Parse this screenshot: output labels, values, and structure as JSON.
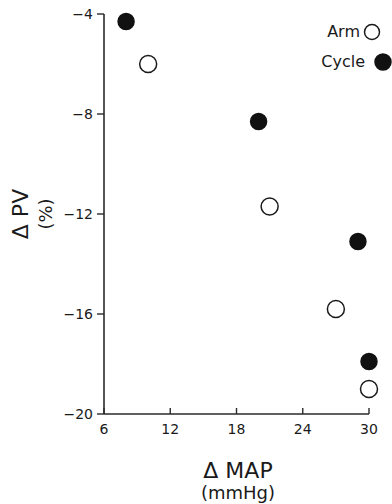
{
  "chart_data": {
    "type": "scatter",
    "title": "",
    "xlabel": "Δ MAP",
    "xlabel_units": "(mmHg)",
    "ylabel": "Δ PV",
    "ylabel_units": "(%)",
    "xlim": [
      6,
      30
    ],
    "ylim": [
      -20,
      -4
    ],
    "x_ticks": [
      6,
      12,
      18,
      24,
      30
    ],
    "y_ticks": [
      -4,
      -8,
      -12,
      -16,
      -20
    ],
    "x_tick_labels": [
      "6",
      "12",
      "18",
      "24",
      "30"
    ],
    "y_tick_labels": [
      "−4",
      "−8",
      "−12",
      "−16",
      "−20"
    ],
    "grid": false,
    "legend_position": "upper right",
    "series": [
      {
        "name": "Arm",
        "marker": "open-circle",
        "color": "#1a1a1a",
        "points": [
          {
            "x": 10,
            "y": -6.0
          },
          {
            "x": 21,
            "y": -11.7
          },
          {
            "x": 27,
            "y": -15.8
          },
          {
            "x": 30,
            "y": -19.0
          }
        ]
      },
      {
        "name": "Cycle",
        "marker": "filled-circle",
        "color": "#111111",
        "points": [
          {
            "x": 8,
            "y": -4.3
          },
          {
            "x": 20,
            "y": -8.3
          },
          {
            "x": 29,
            "y": -13.1
          },
          {
            "x": 30,
            "y": -17.9
          }
        ]
      }
    ]
  },
  "legend": {
    "items": [
      {
        "label": "Arm",
        "marker": "open-circle-icon"
      },
      {
        "label": "Cycle",
        "marker": "filled-circle-icon"
      }
    ]
  }
}
